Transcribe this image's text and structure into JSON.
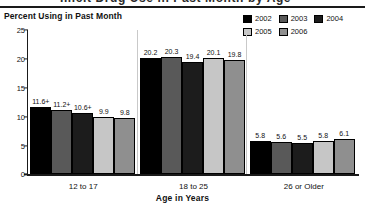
{
  "figure": {
    "y_axis_title": "Percent Using in Past Month",
    "x_axis_title": "Age in Years",
    "clipped_header": "Illicit Drug Use in Past Month by Age"
  },
  "legend": {
    "rows": [
      [
        {
          "label": "2002",
          "color": "#000000"
        },
        {
          "label": "2003",
          "color": "#595959"
        },
        {
          "label": "2004",
          "color": "#1c1c1c"
        }
      ],
      [
        {
          "label": "2005",
          "color": "#c6c6c6"
        },
        {
          "label": "2006",
          "color": "#8f8f8f"
        }
      ]
    ]
  },
  "chart_data": {
    "type": "bar",
    "title": "Percent Using in Past Month",
    "xlabel": "Age in Years",
    "ylabel": "Percent Using in Past Month",
    "ylim": [
      0,
      25
    ],
    "yticks": [
      "0",
      "5",
      "10",
      "15",
      "20",
      "25"
    ],
    "grid": false,
    "legend_position": "top-right",
    "categories": [
      "12 to 17",
      "18 to 25",
      "26 or Older"
    ],
    "series": [
      {
        "name": "2002",
        "color": "#000000",
        "values": [
          11.6,
          20.2,
          5.8
        ],
        "labels": [
          "11.6+",
          "20.2",
          "5.8"
        ]
      },
      {
        "name": "2003",
        "color": "#595959",
        "values": [
          11.2,
          20.3,
          5.6
        ],
        "labels": [
          "11.2+",
          "20.3",
          "5.6"
        ]
      },
      {
        "name": "2004",
        "color": "#1c1c1c",
        "values": [
          10.6,
          19.4,
          5.5
        ],
        "labels": [
          "10.6+",
          "19.4",
          "5.5"
        ]
      },
      {
        "name": "2005",
        "color": "#c6c6c6",
        "values": [
          9.9,
          20.1,
          5.8
        ],
        "labels": [
          "9.9",
          "20.1",
          "5.8"
        ]
      },
      {
        "name": "2006",
        "color": "#8f8f8f",
        "values": [
          9.8,
          19.8,
          6.1
        ],
        "labels": [
          "9.8",
          "19.8",
          "6.1"
        ]
      }
    ],
    "note": "+ denotes difference between this estimate and the 2006 estimate is statistically significant"
  }
}
